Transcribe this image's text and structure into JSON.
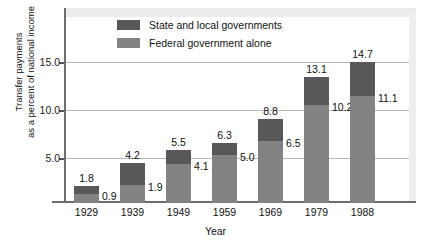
{
  "chart_data": {
    "type": "bar",
    "subtype": "stacked-bar",
    "title": "",
    "xlabel": "Year",
    "ylabel": "Transfer payments\nas a percent of national income",
    "categories": [
      "1929",
      "1939",
      "1949",
      "1959",
      "1969",
      "1979",
      "1988"
    ],
    "series": [
      {
        "name": "Federal government alone",
        "color": "#828284",
        "values": [
          0.9,
          1.9,
          4.1,
          5.0,
          6.5,
          10.2,
          11.1
        ],
        "labels": [
          "0.9",
          "1.9",
          "4.1",
          "5.0",
          "6.5",
          "10.2",
          "11.1"
        ]
      },
      {
        "name": "State and local governments",
        "color": "#58585a",
        "values": [
          0.9,
          2.3,
          1.4,
          1.3,
          2.3,
          2.9,
          3.6
        ],
        "note": "segment heights = total minus federal"
      }
    ],
    "totals": [
      1.8,
      4.2,
      5.5,
      6.3,
      8.8,
      13.1,
      14.7
    ],
    "total_labels": [
      "1.8",
      "4.2",
      "5.5",
      "6.3",
      "8.8",
      "13.1",
      "14.7"
    ],
    "ylim": [
      0,
      16.5
    ],
    "yticks": [
      5.0,
      10.0,
      15.0
    ],
    "ytick_labels": [
      "5.0",
      "10.0",
      "15.0"
    ],
    "grid": true,
    "legend_position": "top-center-inside"
  },
  "legend": {
    "items": [
      {
        "label": "State and local governments",
        "color": "#58585a"
      },
      {
        "label": "Federal government alone",
        "color": "#828284"
      }
    ]
  },
  "axes": {
    "y_title": "Transfer payments\nas a percent of national income",
    "x_title": "Year",
    "y_ticks": [
      "15.0",
      "10.0",
      "5.0"
    ],
    "x_ticks": [
      "1929",
      "1939",
      "1949",
      "1959",
      "1969",
      "1979",
      "1988"
    ]
  },
  "colors": {
    "state_local": "#58585a",
    "federal": "#828284",
    "gridline": "#b9b9bb",
    "axis": "#6e6e70",
    "panel_border": "#ececed",
    "background": "#ffffff",
    "text": "#101010"
  }
}
